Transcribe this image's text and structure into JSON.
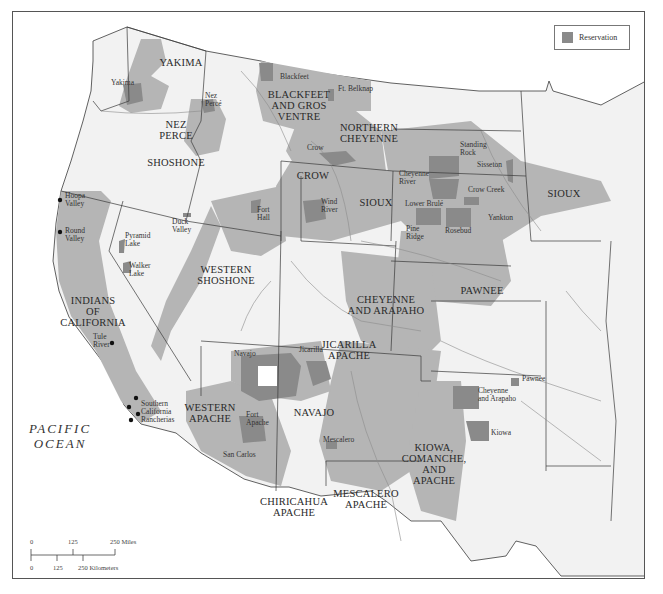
{
  "map": {
    "title": "",
    "colors": {
      "land": "#f2f2f2",
      "water": "#ffffff",
      "territory": "#b5b5b5",
      "reservation": "#8a8a8a",
      "border": "#3a3a3a",
      "river": "#8c8c8c"
    },
    "legend": {
      "reservation_label": "Reservation"
    },
    "ocean_label": [
      "PACIFIC",
      "OCEAN"
    ],
    "tribal_territories": [
      {
        "name": "YAKIMA",
        "x": 180,
        "y": 65
      },
      {
        "name": "NEZ PERCE",
        "lines": [
          "NEZ",
          "PERCE"
        ],
        "x": 175,
        "y": 127
      },
      {
        "name": "SHOSHONE",
        "x": 175,
        "y": 165
      },
      {
        "name": "BLACKFEET AND GROS VENTRE",
        "lines": [
          "BLACKFEET",
          "AND GROS",
          "VENTRE"
        ],
        "x": 298,
        "y": 97
      },
      {
        "name": "NORTHERN CHEYENNE",
        "lines": [
          "NORTHERN",
          "CHEYENNE"
        ],
        "x": 368,
        "y": 130
      },
      {
        "name": "CROW",
        "x": 312,
        "y": 178
      },
      {
        "name": "SIOUX",
        "x": 375,
        "y": 205
      },
      {
        "name": "SIOUX",
        "x": 563,
        "y": 196
      },
      {
        "name": "PAWNEE",
        "x": 481,
        "y": 293
      },
      {
        "name": "INDIANS OF CALIFORNIA",
        "lines": [
          "INDIANS",
          "OF",
          "CALIFORNIA"
        ],
        "x": 92,
        "y": 303
      },
      {
        "name": "WESTERN SHOSHONE",
        "lines": [
          "WESTERN",
          "SHOSHONE"
        ],
        "x": 225,
        "y": 272
      },
      {
        "name": "CHEYENNE AND ARAPAHO",
        "lines": [
          "CHEYENNE",
          "AND ARAPAHO"
        ],
        "x": 385,
        "y": 302
      },
      {
        "name": "JICARILLA APACHE",
        "lines": [
          "JICARILLA",
          "APACHE"
        ],
        "x": 348,
        "y": 347
      },
      {
        "name": "WESTERN APACHE",
        "lines": [
          "WESTERN",
          "APACHE"
        ],
        "x": 209,
        "y": 410
      },
      {
        "name": "NAVAJO",
        "x": 313,
        "y": 415
      },
      {
        "name": "KIOWA, COMANCHE, AND APACHE",
        "lines": [
          "KIOWA,",
          "COMANCHE,",
          "AND",
          "APACHE"
        ],
        "x": 433,
        "y": 450
      },
      {
        "name": "MESCALERO APACHE",
        "lines": [
          "MESCALERO",
          "APACHE"
        ],
        "x": 365,
        "y": 496
      },
      {
        "name": "CHIRICAHUA APACHE",
        "lines": [
          "CHIRICAHUA",
          "APACHE"
        ],
        "x": 293,
        "y": 504
      }
    ],
    "reservations": [
      {
        "name": "Yakima",
        "x": 110,
        "y": 84
      },
      {
        "name": "Nez Percé",
        "lines": [
          "Nez",
          "Percé"
        ],
        "x": 204,
        "y": 97
      },
      {
        "name": "Blackfeet",
        "x": 279,
        "y": 78
      },
      {
        "name": "Ft. Belknap",
        "x": 337,
        "y": 90
      },
      {
        "name": "Crow",
        "x": 306,
        "y": 149
      },
      {
        "name": "Standing Rock",
        "lines": [
          "Standing",
          "Rock"
        ],
        "x": 459,
        "y": 146
      },
      {
        "name": "Sisseton",
        "x": 476,
        "y": 166
      },
      {
        "name": "Cheyenne River",
        "lines": [
          "Cheyenne",
          "River"
        ],
        "x": 398,
        "y": 175
      },
      {
        "name": "Crow Creek",
        "x": 467,
        "y": 191
      },
      {
        "name": "Lower Brulé",
        "x": 404,
        "y": 205
      },
      {
        "name": "Yankton",
        "x": 487,
        "y": 219
      },
      {
        "name": "Pine Ridge",
        "lines": [
          "Pine",
          "Ridge"
        ],
        "x": 405,
        "y": 230
      },
      {
        "name": "Rosebud",
        "x": 444,
        "y": 232
      },
      {
        "name": "Wind River",
        "lines": [
          "Wind",
          "River"
        ],
        "x": 320,
        "y": 203
      },
      {
        "name": "Fort Hall",
        "lines": [
          "Fort",
          "Hall"
        ],
        "x": 256,
        "y": 211
      },
      {
        "name": "Duck Valley",
        "lines": [
          "Duck",
          "Valley"
        ],
        "x": 171,
        "y": 223
      },
      {
        "name": "Hoopa Valley",
        "lines": [
          "Hoopa",
          "Valley"
        ],
        "x": 64,
        "y": 197
      },
      {
        "name": "Round Valley",
        "lines": [
          "Round",
          "Valley"
        ],
        "x": 64,
        "y": 232
      },
      {
        "name": "Pyramid Lake",
        "lines": [
          "Pyramid",
          "Lake"
        ],
        "x": 124,
        "y": 237
      },
      {
        "name": "Walker Lake",
        "lines": [
          "Walker",
          "Lake"
        ],
        "x": 128,
        "y": 267
      },
      {
        "name": "Tule River",
        "lines": [
          "Tule",
          "River"
        ],
        "x": 92,
        "y": 338
      },
      {
        "name": "Southern California Rancherias",
        "lines": [
          "Southern",
          "California",
          "Rancherias"
        ],
        "x": 140,
        "y": 405
      },
      {
        "name": "Navajo",
        "x": 233,
        "y": 355
      },
      {
        "name": "Jicarilla",
        "x": 298,
        "y": 351
      },
      {
        "name": "Fort Apache",
        "lines": [
          "Fort",
          "Apache"
        ],
        "x": 245,
        "y": 416
      },
      {
        "name": "San Carlos",
        "x": 222,
        "y": 456
      },
      {
        "name": "Mescalero",
        "x": 322,
        "y": 441
      },
      {
        "name": "Cheyenne and Arapaho",
        "lines": [
          "Cheyenne",
          "and Arapaho"
        ],
        "x": 477,
        "y": 392
      },
      {
        "name": "Pawnee",
        "x": 521,
        "y": 380
      },
      {
        "name": "Kiowa",
        "x": 490,
        "y": 434
      }
    ],
    "scale_bar": {
      "miles_labels": [
        "0",
        "125",
        "250 Miles"
      ],
      "km_labels": [
        "0",
        "125",
        "250 Kilometers"
      ]
    }
  }
}
